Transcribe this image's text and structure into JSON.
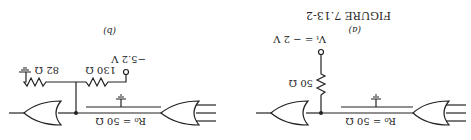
{
  "figure": {
    "caption": "FIGURE 7.13-2",
    "orientation": "rotated 180 degrees",
    "panels": [
      {
        "id": "a",
        "label": "(a)",
        "line_impedance": "R₀ = 50 Ω",
        "resistor": "50 Ω",
        "supply": "Vₜ = − 2 V"
      },
      {
        "id": "b",
        "label": "(b)",
        "line_impedance": "R₀ = 50 Ω",
        "resistor_top": "130 Ω",
        "resistor_bottom": "82 Ω",
        "supply": "−5.2 V"
      }
    ]
  }
}
